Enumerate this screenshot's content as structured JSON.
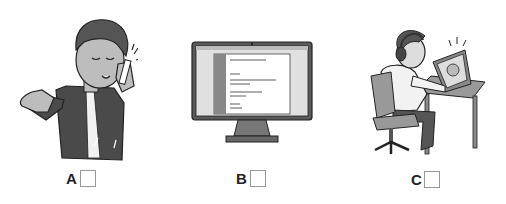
{
  "options": [
    {
      "letter": "A",
      "description": "man talking on mobile phone",
      "checked": false
    },
    {
      "letter": "B",
      "description": "desktop computer monitor",
      "checked": false
    },
    {
      "letter": "C",
      "description": "man with headphones on video call at laptop",
      "checked": false
    }
  ]
}
